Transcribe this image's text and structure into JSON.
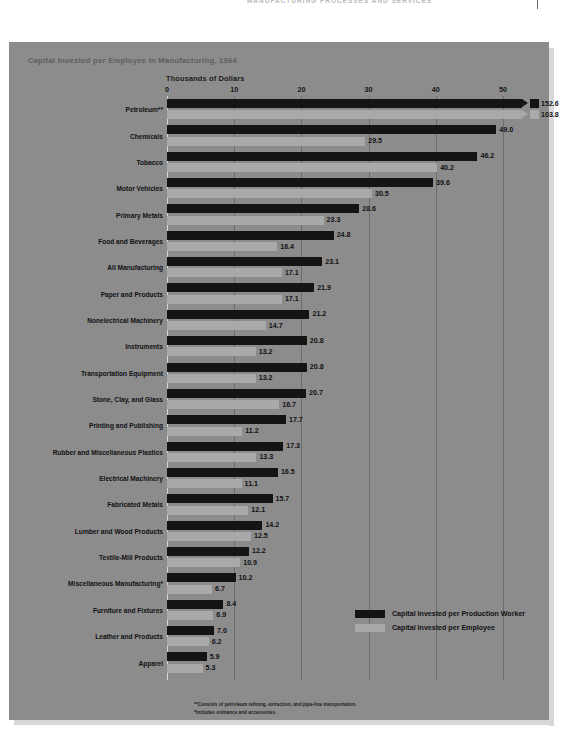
{
  "running_head": {
    "text": "MANUFACTURING PROCESSES AND SERVICES"
  },
  "chart_data": {
    "type": "bar",
    "orientation": "horizontal",
    "title": "Capital Invested per Employee in Manufacturing, 1964",
    "subtitle": "Thousands of Dollars",
    "xlabel": "Thousands of Dollars",
    "ylabel": "",
    "xlim": [
      0,
      55
    ],
    "xticks": [
      "0",
      "10",
      "20",
      "30",
      "40",
      "50"
    ],
    "xtick_values": [
      0,
      10,
      20,
      30,
      40,
      50
    ],
    "grid": true,
    "legend_position": "inside-lower-right",
    "series": [
      {
        "name": "Capital Invested per Production Worker",
        "color": "#141414",
        "values": [
          152.6,
          49.0,
          46.2,
          39.6,
          28.6,
          24.8,
          23.1,
          21.9,
          21.2,
          20.8,
          20.8,
          20.7,
          17.7,
          17.3,
          16.5,
          15.7,
          14.2,
          12.2,
          10.2,
          8.4,
          7.0,
          5.9
        ]
      },
      {
        "name": "Capital Invested per Employee",
        "color": "#a9a9a9",
        "values": [
          103.8,
          29.5,
          40.2,
          30.5,
          23.3,
          16.4,
          17.1,
          17.1,
          14.7,
          13.2,
          13.2,
          16.7,
          11.2,
          13.3,
          11.1,
          12.1,
          12.5,
          10.9,
          6.7,
          6.9,
          6.2,
          5.3
        ]
      }
    ],
    "categories": [
      "Petroleum**",
      "Chemicals",
      "Tobacco",
      "Motor Vehicles",
      "Primary Metals",
      "Food and Beverages",
      "All Manufacturing",
      "Paper and Products",
      "Nonelectrical Machinery",
      "Instruments",
      "Transportation Equipment",
      "Stone, Clay, and Glass",
      "Printing and Publishing",
      "Rubber and Miscellaneous Plastics",
      "Electrical Machinery",
      "Fabricated Metals",
      "Lumber and Wood Products",
      "Textile-Mill Products",
      "Miscellaneous Manufacturing*",
      "Furniture and Fixtures",
      "Leather and Products",
      "Apparel"
    ],
    "value_labels": [
      [
        "152.6",
        "103.8"
      ],
      [
        "49.0",
        "29.5"
      ],
      [
        "46.2",
        "40.2"
      ],
      [
        "39.6",
        "30.5"
      ],
      [
        "28.6",
        "23.3"
      ],
      [
        "24.8",
        "16.4"
      ],
      [
        "23.1",
        "17.1"
      ],
      [
        "21.9",
        "17.1"
      ],
      [
        "21.2",
        "14.7"
      ],
      [
        "20.8",
        "13.2"
      ],
      [
        "20.8",
        "13.2"
      ],
      [
        "20.7",
        "16.7"
      ],
      [
        "17.7",
        "11.2"
      ],
      [
        "17.3",
        "13.3"
      ],
      [
        "16.5",
        "11.1"
      ],
      [
        "15.7",
        "12.1"
      ],
      [
        "14.2",
        "12.5"
      ],
      [
        "12.2",
        "10.9"
      ],
      [
        "10.2",
        "6.7"
      ],
      [
        "8.4",
        "6.9"
      ],
      [
        "7.0",
        "6.2"
      ],
      [
        "5.9",
        "5.3"
      ]
    ],
    "broken_axis_rows": [
      0
    ],
    "annotations": [
      "**Consists of petroleum refining, extraction, and pipe-line transportation.",
      "*Includes ordnance and accessories."
    ]
  },
  "legend": {
    "items": [
      {
        "label": "Capital Invested per Production Worker",
        "color": "#141414"
      },
      {
        "label": "Capital Invested per Employee",
        "color": "#a9a9a9"
      }
    ]
  },
  "footnotes": [
    "**Consists of petroleum refining, extraction, and pipe-line transportation.",
    "*Includes ordnance and accessories."
  ],
  "colors": {
    "panel_background": "#8c8c8c",
    "page_background": "#ffffff",
    "production_worker": "#141414",
    "employee": "#a9a9a9",
    "gridline": "#6c6c6c",
    "title_text": "#5d5d5f",
    "body_text": "#111113"
  }
}
